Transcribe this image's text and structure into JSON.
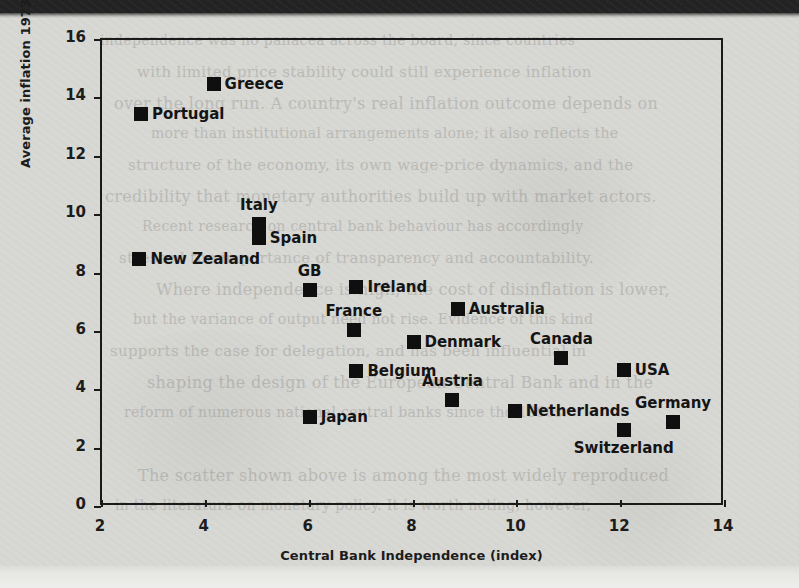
{
  "chart_data": {
    "type": "scatter",
    "title": "",
    "xlabel": "Central Bank Independence (index)",
    "ylabel": "Average inflation 1973–1996 (%)",
    "xlim": [
      2,
      14
    ],
    "ylim": [
      0,
      16
    ],
    "grid": false,
    "legend": "none",
    "marker": "filled-square",
    "marker_color": "#0f0f0f",
    "xticks": [
      {
        "value": 2,
        "label": "2"
      },
      {
        "value": 4,
        "label": "4"
      },
      {
        "value": 6,
        "label": "6"
      },
      {
        "value": 8,
        "label": "8"
      },
      {
        "value": 10,
        "label": "10"
      },
      {
        "value": 12,
        "label": "12"
      },
      {
        "value": 14,
        "label": "14"
      }
    ],
    "yticks": [
      {
        "value": 0,
        "label": "0"
      },
      {
        "value": 2,
        "label": "2"
      },
      {
        "value": 4,
        "label": "4"
      },
      {
        "value": 6,
        "label": "6"
      },
      {
        "value": 8,
        "label": "8"
      },
      {
        "value": 10,
        "label": "10"
      },
      {
        "value": 12,
        "label": "12"
      },
      {
        "value": 14,
        "label": "14"
      },
      {
        "value": 16,
        "label": "16"
      }
    ],
    "points": [
      {
        "label": "Greece",
        "x": 4.15,
        "y": 14.5,
        "label_pos": "right"
      },
      {
        "label": "Portugal",
        "x": 2.75,
        "y": 13.45,
        "label_pos": "right"
      },
      {
        "label": "Italy",
        "x": 5.02,
        "y": 9.7,
        "label_pos": "above"
      },
      {
        "label": "Spain",
        "x": 5.02,
        "y": 9.2,
        "label_pos": "right"
      },
      {
        "label": "New Zealand",
        "x": 2.72,
        "y": 8.5,
        "label_pos": "right"
      },
      {
        "label": "GB",
        "x": 6.0,
        "y": 7.45,
        "label_pos": "above"
      },
      {
        "label": "Ireland",
        "x": 6.9,
        "y": 7.55,
        "label_pos": "right"
      },
      {
        "label": "Australia",
        "x": 8.85,
        "y": 6.8,
        "label_pos": "right"
      },
      {
        "label": "France",
        "x": 6.85,
        "y": 6.05,
        "label_pos": "above"
      },
      {
        "label": "Denmark",
        "x": 8.0,
        "y": 5.65,
        "label_pos": "right"
      },
      {
        "label": "Canada",
        "x": 10.85,
        "y": 5.1,
        "label_pos": "above"
      },
      {
        "label": "USA",
        "x": 12.05,
        "y": 4.7,
        "label_pos": "right"
      },
      {
        "label": "Belgium",
        "x": 6.9,
        "y": 4.65,
        "label_pos": "right"
      },
      {
        "label": "Austria",
        "x": 8.75,
        "y": 3.65,
        "label_pos": "above"
      },
      {
        "label": "Netherlands",
        "x": 9.95,
        "y": 3.3,
        "label_pos": "right"
      },
      {
        "label": "Japan",
        "x": 6.0,
        "y": 3.1,
        "label_pos": "right"
      },
      {
        "label": "Germany",
        "x": 13.0,
        "y": 2.9,
        "label_pos": "above"
      },
      {
        "label": "Switzerland",
        "x": 12.05,
        "y": 2.65,
        "label_pos": "below"
      }
    ]
  },
  "page_scan": {
    "bleed_text": [
      "independence was no panacea across the board, since countries",
      "with limited price stability could still experience inflation",
      "over the long run. A country's real inflation outcome depends on",
      "more than institutional arrangements alone; it also reflects the",
      "structure of the economy, its own wage-price dynamics, and the",
      "credibility that monetary authorities build up with market actors.",
      "Recent research on central bank behaviour has accordingly",
      "stressed the importance of transparency and accountability.",
      "Where independence is high, the cost of disinflation is lower,",
      "but the variance of output need not rise. Evidence of this kind",
      "supports the case for delegation, and has been influential in",
      "shaping the design of the European Central Bank and in the",
      "reform of numerous national central banks since the 1990s.",
      "",
      "The scatter shown above is among the most widely reproduced",
      "in the literature on monetary policy. It is worth noting, however,"
    ]
  }
}
